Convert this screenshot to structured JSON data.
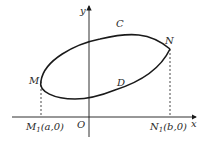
{
  "diagram": {
    "axes": {
      "x_label": "x",
      "y_label": "y",
      "origin_label": "O"
    },
    "points": {
      "M": {
        "label": "M"
      },
      "N": {
        "label": "N"
      },
      "C": {
        "label": "C"
      },
      "D": {
        "label": "D"
      }
    },
    "projections": {
      "M1": {
        "name": "M",
        "sub": "1",
        "coord": "(a,0)"
      },
      "N1": {
        "name": "N",
        "sub": "1",
        "coord": "(b,0)"
      }
    },
    "colors": {
      "stroke": "#1a1a1a",
      "text": "#2a2a2a"
    }
  }
}
